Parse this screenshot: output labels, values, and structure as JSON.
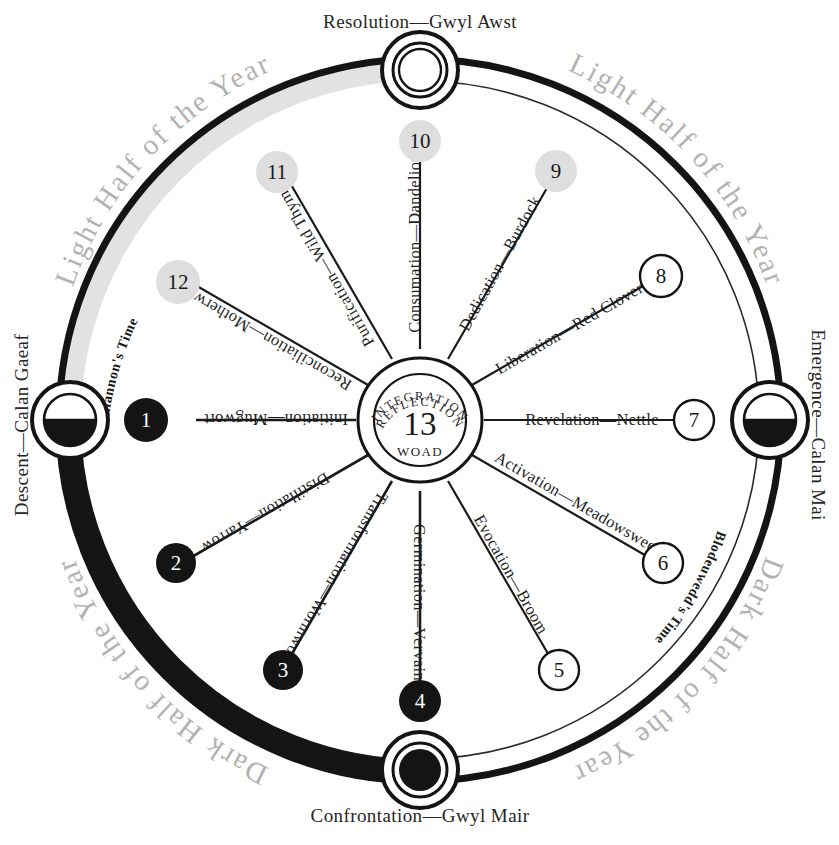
{
  "diagram": {
    "title_top": "Resolution—Gwyl Awst",
    "title_bottom": "Confrontation—Gwyl Mair",
    "title_left": "Descent—Calan Gaeaf",
    "title_right": "Emergence—Calan Mai"
  },
  "halves": {
    "light_left": "Light Half of the Year",
    "light_right": "Light Half of the Year",
    "dark_left": "Dark Half of the Year",
    "dark_right": "Dark Half of the Year"
  },
  "times": {
    "rhiannon": "Rhiannon's Time",
    "ceridwen": "Ceridwen's Time",
    "blodeuwedd": "Blodeuwedd's Time"
  },
  "hub": {
    "outer_arc": "INTEGRATION",
    "inner_arc": "REFLECTION",
    "number": "13",
    "plant": "WOAD"
  },
  "spokes": [
    {
      "num": "1",
      "label": "Initiation—Mugwort",
      "style": "filled-black"
    },
    {
      "num": "2",
      "label": "Distillation—Yarrow",
      "style": "filled-black"
    },
    {
      "num": "3",
      "label": "Transformation—Wormwood",
      "style": "filled-black"
    },
    {
      "num": "4",
      "label": "Germination—Vervain",
      "style": "filled-black"
    },
    {
      "num": "5",
      "label": "Evocation—Broom",
      "style": "outline-white"
    },
    {
      "num": "6",
      "label": "Activation—Meadowsweet",
      "style": "outline-white"
    },
    {
      "num": "7",
      "label": "Revelation—Nettle",
      "style": "outline-white"
    },
    {
      "num": "8",
      "label": "Liberation—Red Clover",
      "style": "outline-white"
    },
    {
      "num": "9",
      "label": "Dedication—Burdock",
      "style": "filled-gray"
    },
    {
      "num": "10",
      "label": "Consumation—Dandelion",
      "style": "filled-gray"
    },
    {
      "num": "11",
      "label": "Purification—Wild Thyme",
      "style": "filled-gray"
    },
    {
      "num": "12",
      "label": "Reconciliation—Motherwort",
      "style": "filled-gray"
    }
  ],
  "moons": {
    "top": "full-ring-moon-icon",
    "right": "half-moon-icon",
    "bottom": "dark-moon-icon",
    "left": "half-moon-icon"
  },
  "colors": {
    "ink": "#1a1a1a",
    "dark_band": "#151515",
    "light_band": "#e0e0e0",
    "gray_node": "#dcdcdc",
    "half_label": "#b2b2b2"
  }
}
